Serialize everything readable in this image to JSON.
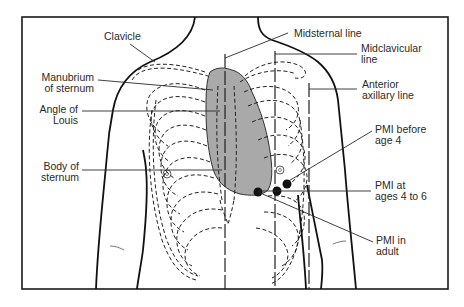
{
  "figure": {
    "type": "anatomical-diagram",
    "colors": {
      "frame": "#1a1a1a",
      "heart_fill": "#a9a9a9",
      "line": "#2a2a2a",
      "background": "#ffffff",
      "dot": "#111111"
    }
  },
  "labels": {
    "clavicle": "Clavicle",
    "manubrium": "Manubrium\nof sternum",
    "angle_of_louis": "Angle of\nLouis",
    "body_of_sternum": "Body of\nsternum",
    "midsternal_line": "Midsternal line",
    "midclavicular_line": "Midclavicular\nline",
    "anterior_axillary_line": "Anterior\naxillary line",
    "pmi_before_age_4": "PMI before\nage 4",
    "pmi_ages_4_to_6": "PMI at\nages 4 to 6",
    "pmi_adult": "PMI in\nadult"
  },
  "markers": [
    {
      "name": "pmi-before-age-4",
      "x": 287,
      "y": 184
    },
    {
      "name": "pmi-ages-4-to-6",
      "x": 277,
      "y": 191
    },
    {
      "name": "pmi-adult",
      "x": 258,
      "y": 192
    }
  ]
}
